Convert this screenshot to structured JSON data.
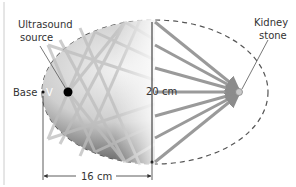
{
  "diagram": {
    "labels": {
      "ultrasound_source_line1": "Ultrasound",
      "ultrasound_source_line2": "source",
      "kidney_stone_line1": "Kidney",
      "kidney_stone_line2": "stone",
      "base": "Base",
      "vertex": "V",
      "width_dimension": "20 cm",
      "length_dimension": "16 cm"
    },
    "measurements": {
      "minor_axis_cm": 20,
      "base_to_center_cm": 16
    },
    "colors": {
      "reflector_dark": "#3a3a3a",
      "reflector_light": "#e8e8e8",
      "beam": "#9a9a9a",
      "outline_dashed": "#555555",
      "text": "#333333",
      "source_dot": "#000000",
      "stone": "#bbbbbb"
    }
  }
}
